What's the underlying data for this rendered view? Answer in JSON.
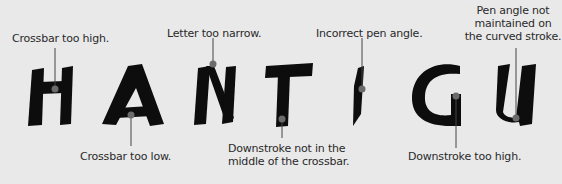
{
  "diagram": {
    "word": "HANTIGU",
    "letters": [
      "H",
      "A",
      "N",
      "T",
      "I",
      "G",
      "U"
    ],
    "colors": {
      "background": "#e9e9e9",
      "ink": "#0d0d0d",
      "leader_line": "#444444",
      "marker_dot": "#6b6b6b",
      "text": "#2a2a2a"
    },
    "annotations": [
      {
        "letter": "H",
        "text": "Crossbar too high."
      },
      {
        "letter": "A",
        "text": "Crossbar too low."
      },
      {
        "letter": "N",
        "text": "Letter too narrow."
      },
      {
        "letter": "T",
        "line1": "Downstroke not in the",
        "line2": "middle of the crossbar."
      },
      {
        "letter": "I",
        "text": "Incorrect pen angle."
      },
      {
        "letter": "G",
        "text": "Downstroke too high."
      },
      {
        "letter": "U",
        "line1": "Pen angle not",
        "line2": "maintained on",
        "line3": "the curved stroke."
      }
    ]
  }
}
